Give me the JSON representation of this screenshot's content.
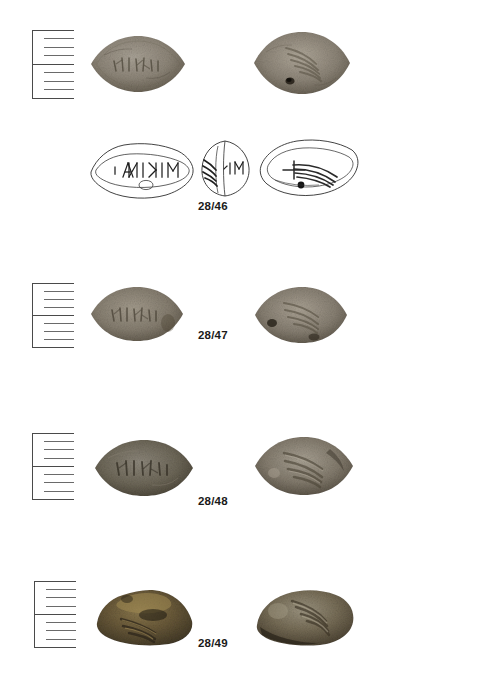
{
  "plate": {
    "title": "Lead sling bullets catalogue plate",
    "background_color": "#ffffff",
    "width": 479,
    "height": 680
  },
  "rows": [
    {
      "catalogue_number": "28/46",
      "scale_label": "scale-bar",
      "obverse_caption": "obverse-photograph",
      "reverse_caption": "reverse-photograph",
      "inscription": "MIKINA",
      "inscription_direction": "retrograde",
      "has_drawings": true,
      "drawings": [
        {
          "view": "obverse-drawing",
          "inscription": "MIKINA"
        },
        {
          "view": "section-drawing",
          "inscription": "MI"
        },
        {
          "view": "reverse-drawing",
          "motif": "thunderbolt"
        }
      ]
    },
    {
      "catalogue_number": "28/47",
      "scale_label": "scale-bar",
      "obverse_caption": "obverse-photograph",
      "reverse_caption": "reverse-photograph",
      "inscription": "MIKINA",
      "inscription_direction": "retrograde",
      "has_drawings": false
    },
    {
      "catalogue_number": "28/48",
      "scale_label": "scale-bar",
      "obverse_caption": "obverse-photograph",
      "reverse_caption": "reverse-photograph",
      "inscription": "MIKINA",
      "inscription_direction": "retrograde",
      "has_drawings": false
    },
    {
      "catalogue_number": "28/49",
      "scale_label": "scale-bar",
      "obverse_caption": "obverse-photograph",
      "reverse_caption": "reverse-photograph",
      "inscription": "MIKINA",
      "inscription_direction": "retrograde",
      "has_drawings": false
    }
  ],
  "colors": {
    "ink": "#1a1a1a",
    "line": "#3a3a3a",
    "scale_line": "#555555",
    "stone_light": "#9b958a",
    "stone_mid": "#7d7569",
    "stone_dark": "#575043",
    "stone_brown": "#6b5a3c",
    "stone_ochre": "#8a7145",
    "background": "#ffffff"
  },
  "scale_bar": {
    "major_divisions": 2,
    "ticks_per_division": 4
  }
}
